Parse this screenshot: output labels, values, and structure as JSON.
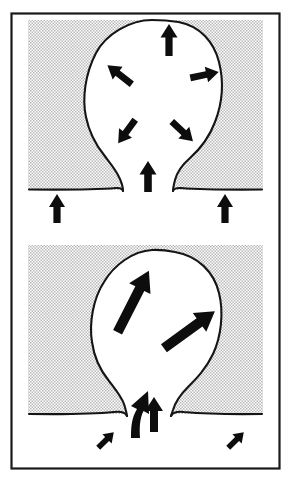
{
  "figure": {
    "caption": "",
    "background_color": "#ffffff",
    "ink_color": "#151515",
    "shading_color": "#cccccc",
    "frame": {
      "label": "outer-rectangle-border",
      "stroke_color": "#1a1a1a",
      "x": 11,
      "y": 13,
      "width": 269,
      "height": 456
    }
  },
  "panels": [
    {
      "id": "panel-upper",
      "label": "Upper panel — radial inflation stage",
      "order": 1,
      "shaded_region": {
        "label": "host rock shading",
        "fill": "halftone-dots",
        "x": 28,
        "y": 20,
        "width": 235,
        "height": 169
      },
      "body": {
        "label": "diapir bulb with narrow stem",
        "fill": "#ffffff",
        "outline_color": "#151515"
      },
      "ground_line": {
        "label": "overburden surface",
        "y": 189
      },
      "arrows": [
        {
          "name": "arrow-bulb-top-up",
          "direction": "up",
          "angle_deg": 0,
          "length": "medium",
          "inside_body": true
        },
        {
          "name": "arrow-bulb-upper-left",
          "direction": "up-left",
          "angle_deg": -55,
          "length": "medium",
          "inside_body": true
        },
        {
          "name": "arrow-bulb-upper-right",
          "direction": "right",
          "angle_deg": 78,
          "length": "medium",
          "inside_body": true
        },
        {
          "name": "arrow-bulb-lower-left",
          "direction": "down-left",
          "angle_deg": -145,
          "length": "medium",
          "inside_body": true
        },
        {
          "name": "arrow-bulb-lower-right",
          "direction": "down-right",
          "angle_deg": 132,
          "length": "medium",
          "inside_body": true
        },
        {
          "name": "arrow-stem-up",
          "direction": "up",
          "angle_deg": 0,
          "length": "short",
          "inside_body": true
        },
        {
          "name": "arrow-ground-left-up",
          "direction": "up",
          "angle_deg": 0,
          "length": "short",
          "inside_body": false
        },
        {
          "name": "arrow-ground-right-up",
          "direction": "up",
          "angle_deg": 0,
          "length": "short",
          "inside_body": false
        }
      ],
      "arrow_count": 8
    },
    {
      "id": "panel-lower",
      "label": "Lower panel — oblique ascent stage",
      "order": 2,
      "shaded_region": {
        "label": "host rock shading",
        "fill": "halftone-dots",
        "x": 28,
        "y": 245,
        "width": 235,
        "height": 168
      },
      "body": {
        "label": "diapir bulb with narrow stem",
        "fill": "#ffffff",
        "outline_color": "#151515"
      },
      "ground_line": {
        "label": "overburden surface",
        "y": 413
      },
      "arrows": [
        {
          "name": "arrow-bulb-long-upleft",
          "direction": "up-right",
          "angle_deg": 28,
          "length": "long",
          "inside_body": true
        },
        {
          "name": "arrow-bulb-long-right",
          "direction": "up-right",
          "angle_deg": 53,
          "length": "long",
          "inside_body": true
        },
        {
          "name": "arrow-stem-curved",
          "direction": "up-curving",
          "angle_deg": 0,
          "length": "medium",
          "inside_body": true,
          "curved": true
        },
        {
          "name": "arrow-stem-up",
          "direction": "up",
          "angle_deg": 0,
          "length": "short",
          "inside_body": true
        },
        {
          "name": "arrow-ground-left-upright",
          "direction": "up-right",
          "angle_deg": 45,
          "length": "tiny",
          "inside_body": false
        },
        {
          "name": "arrow-ground-right-upright",
          "direction": "up-right",
          "angle_deg": 45,
          "length": "tiny",
          "inside_body": false
        }
      ],
      "arrow_count": 6
    }
  ]
}
